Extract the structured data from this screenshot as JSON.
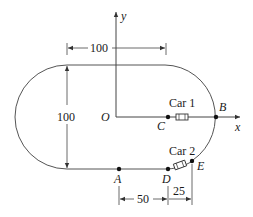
{
  "diagram": {
    "type": "race track with two cars",
    "axes": {
      "x_label": "x",
      "y_label": "y",
      "origin_label": "O"
    },
    "points": {
      "A": "A",
      "B": "B",
      "C": "C",
      "D": "D",
      "E": "E"
    },
    "cars": [
      {
        "label": "Car 1"
      },
      {
        "label": "Car 2"
      }
    ],
    "dimensions": {
      "top_width": "100",
      "left_height": "100",
      "A_to_D": "50",
      "D_to_E": "25"
    },
    "colors": {
      "line": "#4a4a4a",
      "text": "#1a1a1a",
      "background": "#ffffff"
    }
  }
}
